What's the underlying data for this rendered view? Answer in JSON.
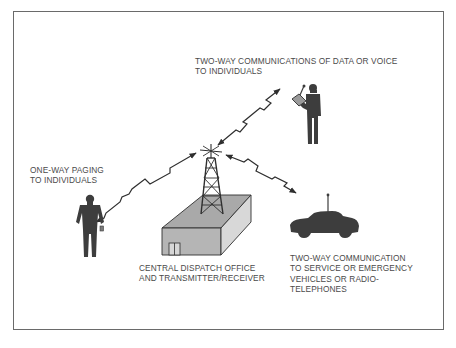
{
  "diagram": {
    "labels": {
      "two_way_data_voice": [
        "TWO-WAY COMMUNICATIONS OF DATA OR VOICE",
        "TO INDIVIDUALS"
      ],
      "one_way_paging": [
        "ONE-WAY PAGING",
        "TO INDIVIDUALS"
      ],
      "central_dispatch": [
        "CENTRAL DISPATCH OFFICE",
        "AND TRANSMITTER/RECEIVER"
      ],
      "two_way_vehicles": [
        "TWO-WAY COMMUNICATION",
        "TO SERVICE OR EMERGENCY",
        "VEHICLES OR RADIO-",
        "TELEPHONES"
      ]
    },
    "nodes": [
      {
        "id": "tower",
        "icon": "radio-tower-icon",
        "label": "CENTRAL DISPATCH OFFICE AND TRANSMITTER/RECEIVER"
      },
      {
        "id": "person-terminal",
        "icon": "person-with-handheld-terminal-icon",
        "label": "TWO-WAY COMMUNICATIONS OF DATA OR VOICE TO INDIVIDUALS"
      },
      {
        "id": "person-pager",
        "icon": "person-with-pager-icon",
        "label": "ONE-WAY PAGING TO INDIVIDUALS"
      },
      {
        "id": "vehicle",
        "icon": "car-with-antenna-icon",
        "label": "TWO-WAY COMMUNICATION TO SERVICE OR EMERGENCY VEHICLES OR RADIO-TELEPHONES"
      }
    ],
    "links": [
      {
        "from": "tower",
        "to": "person-terminal",
        "direction": "two-way"
      },
      {
        "from": "tower",
        "to": "person-pager",
        "direction": "two-way"
      },
      {
        "from": "tower",
        "to": "vehicle",
        "direction": "two-way"
      }
    ],
    "colors": {
      "ink": "#3a3a3a",
      "fill": "#a9a9a9",
      "frame": "#6a6a6a",
      "text": "#4a4a4a"
    }
  }
}
